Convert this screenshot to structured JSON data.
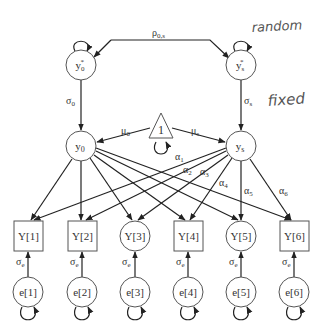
{
  "diagram": {
    "type": "structural-equation-model",
    "annotations": {
      "random": "random",
      "fixed": "fixed"
    },
    "nodes": {
      "y0_star": {
        "label": "y",
        "sub": "0",
        "sup": "*",
        "shape": "circle"
      },
      "ys_star": {
        "label": "y",
        "sub": "s",
        "sup": "*",
        "shape": "circle"
      },
      "y0": {
        "label": "y",
        "sub": "0",
        "shape": "circle"
      },
      "ys": {
        "label": "y",
        "sub": "s",
        "shape": "circle"
      },
      "const": {
        "label": "1",
        "shape": "triangle"
      },
      "observed": [
        {
          "label": "Y[1]",
          "shape": "square"
        },
        {
          "label": "Y[2]",
          "shape": "square"
        },
        {
          "label": "Y[3]",
          "shape": "circle"
        },
        {
          "label": "Y[4]",
          "shape": "square"
        },
        {
          "label": "Y[5]",
          "shape": "circle"
        },
        {
          "label": "Y[6]",
          "shape": "square"
        }
      ],
      "errors": [
        {
          "label": "e[1]"
        },
        {
          "label": "e[2]"
        },
        {
          "label": "e[3]"
        },
        {
          "label": "e[4]"
        },
        {
          "label": "e[5]"
        },
        {
          "label": "e[6]"
        }
      ]
    },
    "paths": {
      "rho": {
        "label": "ρ",
        "sub": "0,s"
      },
      "sigma0": {
        "label": "σ",
        "sub": "0"
      },
      "sigmas": {
        "label": "σ",
        "sub": "s"
      },
      "mu0": {
        "label": "μ",
        "sub": "0"
      },
      "mus": {
        "label": "μ",
        "sub": "s"
      },
      "alphas": [
        {
          "label": "α",
          "sub": "1"
        },
        {
          "label": "α",
          "sub": "2"
        },
        {
          "label": "α",
          "sub": "3"
        },
        {
          "label": "α",
          "sub": "4"
        },
        {
          "label": "α",
          "sub": "5"
        },
        {
          "label": "α",
          "sub": "6"
        }
      ],
      "sigma_e": {
        "label": "σ",
        "sub": "e"
      }
    }
  }
}
